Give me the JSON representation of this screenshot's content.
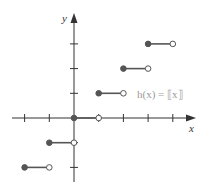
{
  "chart_data": {
    "type": "step",
    "title": "",
    "function_label": "h(x) = ⟦x⟧",
    "xlabel": "x",
    "ylabel": "y",
    "xlim": [
      -2,
      4
    ],
    "ylim": [
      -2,
      3
    ],
    "x_ticks": [
      -2,
      -1,
      1,
      2,
      3,
      4
    ],
    "y_ticks": [
      -2,
      -1,
      1,
      2,
      3
    ],
    "segments": [
      {
        "x_start": -2,
        "x_end": -1,
        "y": -2,
        "start_closed": true,
        "end_closed": false
      },
      {
        "x_start": -1,
        "x_end": 0,
        "y": -1,
        "start_closed": true,
        "end_closed": false
      },
      {
        "x_start": 0,
        "x_end": 1,
        "y": 0,
        "start_closed": true,
        "end_closed": false
      },
      {
        "x_start": 1,
        "x_end": 2,
        "y": 1,
        "start_closed": true,
        "end_closed": false
      },
      {
        "x_start": 2,
        "x_end": 3,
        "y": 2,
        "start_closed": true,
        "end_closed": false
      },
      {
        "x_start": 3,
        "x_end": 4,
        "y": 3,
        "start_closed": true,
        "end_closed": false
      }
    ],
    "grid": false
  },
  "colors": {
    "axis": "#333333",
    "segment": "#555555",
    "filled_point": "#555555",
    "open_point_fill": "#ffffff",
    "label": "#9a9a9a"
  }
}
